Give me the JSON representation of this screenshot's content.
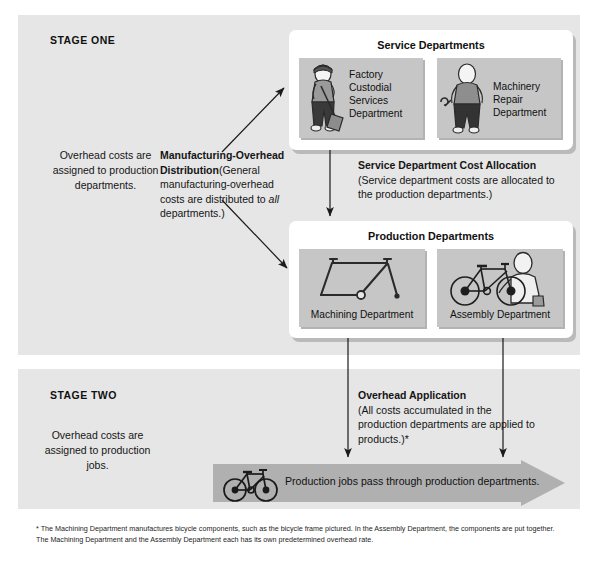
{
  "stage_one": {
    "label": "STAGE ONE",
    "left_note": "Overhead costs are assigned to production departments.",
    "mfg_overhead_distribution": {
      "title": "Manufacturing-Overhead Distribution",
      "body_before_italic": "(General manufacturing-overhead costs are distributed to ",
      "italic_word": "all",
      "body_after_italic": " departments.)"
    },
    "service_dept_cost_allocation": {
      "title": "Service Department Cost Allocation",
      "body": "(Service department costs are allocated to the production departments.)"
    },
    "service_departments": {
      "title": "Service Departments",
      "cards": [
        {
          "label": "Factory Custodial Services Department",
          "icon": "janitor-with-broom-icon"
        },
        {
          "label": "Machinery Repair Department",
          "icon": "mechanic-with-wrench-icon"
        }
      ]
    },
    "production_departments": {
      "title": "Production Departments",
      "cards": [
        {
          "label": "Machining Department",
          "icon": "bicycle-frame-icon"
        },
        {
          "label": "Assembly Department",
          "icon": "worker-assembling-bicycle-icon"
        }
      ]
    }
  },
  "stage_two": {
    "label": "STAGE TWO",
    "left_note": "Overhead costs are assigned to production jobs.",
    "overhead_application": {
      "title": "Overhead Application",
      "body": "(All costs accumulated in the production departments are applied to products.)*"
    },
    "flow_banner": {
      "label": "Production jobs pass through production departments.",
      "icon": "bicycle-icon"
    }
  },
  "footnote": "* The Machining Department manufactures bicycle components, such as the bicycle frame pictured. In the Assembly Department, the components are put together. The Machining Department and the Assembly Department each has its own predetermined overhead rate.",
  "colors": {
    "panel_background": "#e6e6e6",
    "group_box": "#ffffff",
    "department_card": "#c6c6c6",
    "banner_arrow": "#b0b0b0",
    "text": "#151515",
    "line": "#1a1a1a"
  }
}
